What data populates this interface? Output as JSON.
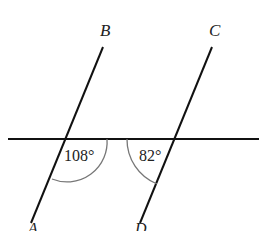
{
  "diagram": {
    "points": [
      {
        "name": "B",
        "x": 106,
        "y": 24
      },
      {
        "name": "C",
        "x": 215,
        "y": 24
      }
    ],
    "angles": [
      {
        "label": "108°",
        "vertex": "left-intersection",
        "x": 64,
        "y": 148
      },
      {
        "label": "82°",
        "vertex": "right-intersection",
        "x": 139,
        "y": 148
      }
    ],
    "lines": {
      "transversal": {
        "x1": 8,
        "y1": 139,
        "x2": 259,
        "y2": 139
      },
      "left": {
        "x1": 103,
        "y1": 47,
        "x2": 31,
        "y2": 223
      },
      "right": {
        "x1": 212,
        "y1": 47,
        "x2": 140,
        "y2": 223
      }
    },
    "colors": {
      "line": "#111111",
      "arc": "#777777"
    }
  }
}
